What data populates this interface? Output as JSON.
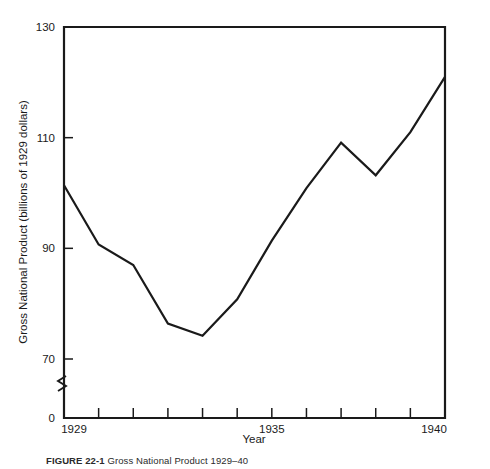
{
  "figure": {
    "caption_number": "FIGURE 22-1",
    "caption_text": "Gross National Product 1929–40"
  },
  "chart_data": {
    "type": "line",
    "title": "",
    "xlabel": "Year",
    "ylabel": "Gross National Product (billions of 1929 dollars)",
    "x": [
      1929,
      1930,
      1931,
      1932,
      1933,
      1934,
      1935,
      1936,
      1937,
      1938,
      1939,
      1940
    ],
    "values": [
      101.4,
      90.7,
      87.0,
      76.4,
      74.2,
      80.8,
      91.4,
      100.9,
      109.1,
      103.2,
      111.0,
      121.0
    ],
    "series": [
      {
        "name": "Gross National Product",
        "values": [
          101.4,
          90.7,
          87.0,
          76.4,
          74.2,
          80.8,
          91.4,
          100.9,
          109.1,
          103.2,
          111.0,
          121.0
        ]
      }
    ],
    "xlim": [
      1929,
      1940
    ],
    "ylim": [
      0,
      130
    ],
    "y_axis_break": true,
    "y_break_between": [
      0,
      70
    ],
    "grid": false,
    "legend": "none",
    "y_ticks": [
      {
        "value": 0,
        "label": "0"
      },
      {
        "value": 70,
        "label": "70"
      },
      {
        "value": 90,
        "label": "90"
      },
      {
        "value": 110,
        "label": "110"
      },
      {
        "value": 130,
        "label": "130"
      }
    ],
    "x_ticks": [
      {
        "value": 1929,
        "label": "1929"
      },
      {
        "value": 1930,
        "label": ""
      },
      {
        "value": 1931,
        "label": ""
      },
      {
        "value": 1932,
        "label": ""
      },
      {
        "value": 1933,
        "label": ""
      },
      {
        "value": 1934,
        "label": ""
      },
      {
        "value": 1935,
        "label": "1935"
      },
      {
        "value": 1936,
        "label": ""
      },
      {
        "value": 1937,
        "label": ""
      },
      {
        "value": 1938,
        "label": ""
      },
      {
        "value": 1939,
        "label": ""
      },
      {
        "value": 1940,
        "label": "1940"
      }
    ],
    "line_color": "#1a1a1a",
    "axis_color": "#1a1a1a",
    "background_color": "#ffffff"
  }
}
